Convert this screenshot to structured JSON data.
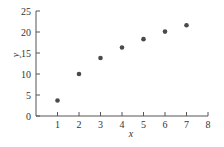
{
  "chart_data": {
    "type": "scatter",
    "title": "",
    "xlabel": "x",
    "ylabel": "y",
    "xlim": [
      0,
      8
    ],
    "ylim": [
      0,
      25
    ],
    "xticks": [
      1,
      2,
      3,
      4,
      5,
      6,
      7,
      8
    ],
    "yticks": [
      0,
      5,
      10,
      15,
      20,
      25
    ],
    "grid": false,
    "legend": null,
    "series": [
      {
        "name": "data",
        "color": "#4a4a4a",
        "x": [
          1,
          2,
          3,
          4,
          5,
          6,
          7
        ],
        "y": [
          3.7,
          10.0,
          13.8,
          16.3,
          18.3,
          20.1,
          21.6
        ]
      }
    ]
  },
  "style": {
    "axis_color": "#555555",
    "marker_color": "#4a4a4a"
  }
}
